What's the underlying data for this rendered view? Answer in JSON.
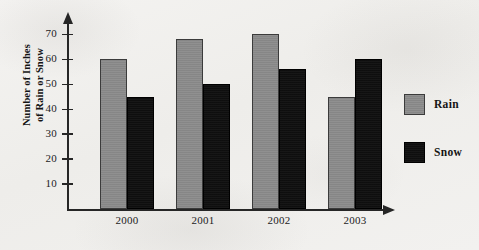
{
  "chart_data": {
    "type": "bar",
    "title": "",
    "xlabel": "",
    "ylabel": "Number of Inches of Rain or Snow",
    "ylabel_line1": "Number of Inches",
    "ylabel_line2": "of Rain or Snow",
    "categories": [
      "2000",
      "2001",
      "2002",
      "2003"
    ],
    "series": [
      {
        "name": "Rain",
        "color": "#8b8b8b",
        "values": [
          60,
          68,
          70,
          45
        ]
      },
      {
        "name": "Snow",
        "color": "#0f0f0f",
        "values": [
          45,
          50,
          56,
          60
        ]
      }
    ],
    "ylim": [
      0,
      75
    ],
    "y_ticks": [
      10,
      20,
      30,
      40,
      50,
      60,
      70
    ],
    "grid": false,
    "legend_position": "right",
    "axis_arrows": true
  },
  "legend": {
    "items": [
      {
        "label": "Rain",
        "swatch": "rain"
      },
      {
        "label": "Snow",
        "swatch": "snow"
      }
    ]
  }
}
